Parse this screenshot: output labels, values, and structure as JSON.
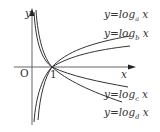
{
  "figure": {
    "axes": {
      "x_label": "x",
      "y_label": "y",
      "origin_label": "O",
      "unit_tick_label": "1"
    },
    "curves": [
      {
        "id": "a",
        "prefix": "y=log",
        "base": "a",
        "suffix": " x",
        "position": "upper"
      },
      {
        "id": "b",
        "prefix": "y=log",
        "base": "b",
        "suffix": " x",
        "position": "upper"
      },
      {
        "id": "c",
        "prefix": "y=log",
        "base": "c",
        "suffix": " x",
        "position": "lower"
      },
      {
        "id": "d",
        "prefix": "y=log",
        "base": "d",
        "suffix": " x",
        "position": "lower"
      }
    ],
    "colors": {
      "line": "#333333",
      "axis": "#555555",
      "background": "#ffffff"
    }
  }
}
